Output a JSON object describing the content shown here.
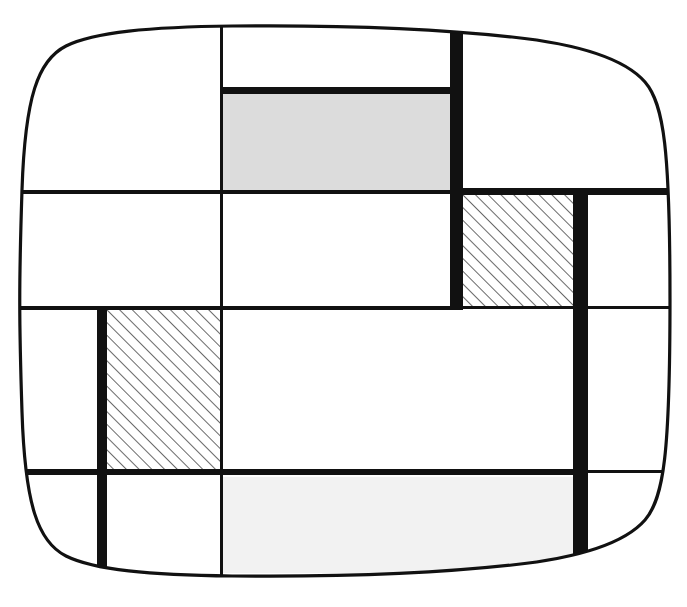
{
  "artwork": {
    "style": "neoplasticism-mondrian-grid",
    "canvas_width": 687,
    "canvas_height": 607,
    "background_color": "#ffffff",
    "line_color": "#111111",
    "outline_shape": "rounded-squircle",
    "ghost_mark_text": "",
    "ghost_caption_text": ""
  },
  "palette": {
    "black": "#111111",
    "white": "#ffffff",
    "gray_dark": "#dcdcdc",
    "gray_light": "#f2f2f2",
    "hatch_stroke": "#2a2a2a"
  },
  "fills": [
    {
      "name": "gray-panel-upper",
      "kind": "solid",
      "color": "#dcdcdc",
      "x": 222,
      "y": 91,
      "width": 228,
      "height": 101
    },
    {
      "name": "gray-panel-lower",
      "kind": "solid",
      "color": "#f2f2f2",
      "x": 222,
      "y": 477,
      "width": 352,
      "height": 96
    },
    {
      "name": "hatched-panel-right",
      "kind": "hatch",
      "color": "#ffffff",
      "x": 462,
      "y": 192,
      "width": 111,
      "height": 116
    },
    {
      "name": "hatched-panel-left",
      "kind": "hatch",
      "color": "#ffffff",
      "x": 107,
      "y": 308,
      "width": 115,
      "height": 164
    }
  ],
  "grid_lines": {
    "horizontal": [
      {
        "name": "rule-upper-gray-top",
        "y": 91,
        "x1": 222,
        "x2": 450,
        "weight": 7
      },
      {
        "name": "rule-mid-upper",
        "y": 192,
        "x1": 22,
        "x2": 450,
        "weight": 4
      },
      {
        "name": "rule-mid-upper-right",
        "y": 192,
        "x1": 462,
        "x2": 668,
        "weight": 7
      },
      {
        "name": "rule-mid-lower",
        "y": 308,
        "x1": 20,
        "x2": 450,
        "weight": 4
      },
      {
        "name": "rule-mid-lower-right",
        "y": 308,
        "x1": 462,
        "x2": 671,
        "weight": 3
      },
      {
        "name": "rule-bottom",
        "y": 472,
        "x1": 25,
        "x2": 573,
        "weight": 6
      },
      {
        "name": "rule-bottom-right",
        "y": 472,
        "x1": 588,
        "x2": 665,
        "weight": 3
      }
    ],
    "vertical": [
      {
        "name": "bar-left-thick",
        "x": 102,
        "y1": 308,
        "y2": 570,
        "weight": 10
      },
      {
        "name": "rule-left-thin",
        "x": 222,
        "y1": 30,
        "y2": 580,
        "weight": 3
      },
      {
        "name": "bar-center-thick",
        "x": 456,
        "y1": 26,
        "y2": 308,
        "weight": 13
      },
      {
        "name": "bar-right-thick",
        "x": 580,
        "y1": 192,
        "y2": 570,
        "weight": 15
      }
    ]
  },
  "hatching": {
    "angle_degrees": 45,
    "direction": "rising-to-right",
    "spacing_px": 9,
    "stroke_width": 1.4
  }
}
